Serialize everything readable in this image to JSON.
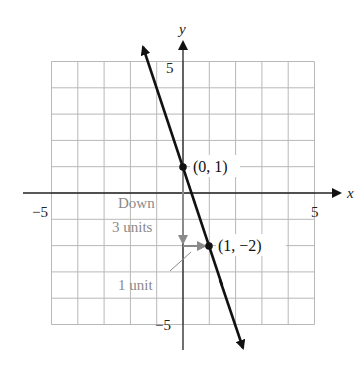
{
  "chart_data": {
    "type": "line",
    "title": "",
    "xlabel": "x",
    "ylabel": "y",
    "xlim": [
      -6,
      6
    ],
    "ylim": [
      -6,
      6
    ],
    "grid": true,
    "grid_range": {
      "x": [
        -5,
        5
      ],
      "y": [
        -5,
        5
      ]
    },
    "x_ticks_labeled": [
      -5,
      5
    ],
    "y_ticks_labeled": [
      5,
      -5
    ],
    "series": [
      {
        "name": "y = -3x + 1",
        "slope": -3,
        "intercept": 1,
        "x": [
          -1.73,
          2.4
        ],
        "y": [
          6.2,
          -6.2
        ],
        "arrows_both_ends": true
      }
    ],
    "points": [
      {
        "x": 0,
        "y": 1,
        "label": "(0, 1)"
      },
      {
        "x": 1,
        "y": -2,
        "label": "(1, -2)"
      }
    ],
    "annotations": [
      {
        "text": "Down",
        "line2": "3 units",
        "type": "arrow",
        "from": [
          0,
          1
        ],
        "to": [
          0,
          -2
        ],
        "color": "#8a8a8a"
      },
      {
        "text": "1 unit",
        "type": "arrow",
        "from": [
          0,
          -2
        ],
        "to": [
          1,
          -2
        ],
        "color": "#8a8a8a"
      }
    ]
  },
  "labels": {
    "x_axis": "x",
    "y_axis": "y",
    "x_neg": "−5",
    "x_pos": "5",
    "y_pos": "5",
    "y_neg": "−5",
    "p1": "(0, 1)",
    "p2": "(1, −2)",
    "down_line1": "Down",
    "down_line2": "3 units",
    "one_unit": "1 unit"
  },
  "colors": {
    "grid": "#b8b8b8",
    "axis": "#222222",
    "line": "#111111",
    "annotation": "#8a8a8a"
  }
}
